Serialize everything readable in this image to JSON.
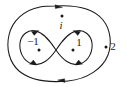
{
  "figure": {
    "type": "contour-diagram",
    "background_color": "#ffffff",
    "stroke_color": "#1a1a1a",
    "width": 127,
    "height": 87
  },
  "points": [
    {
      "id": "minus-one",
      "label": "−1",
      "style": "upright",
      "x": 39,
      "y": 50,
      "label_x": 33,
      "label_y": 42,
      "location": "inside left lobe"
    },
    {
      "id": "plus-one",
      "label": "1",
      "style": "upright",
      "x": 73,
      "y": 50,
      "label_x": 78,
      "label_y": 43,
      "location": "inside right lobe"
    },
    {
      "id": "imaginary-unit",
      "label": "i",
      "style": "italic",
      "x": 62,
      "y": 16,
      "label_x": 60,
      "label_y": 25,
      "location": "inside outer contour, above figure-eight"
    },
    {
      "id": "two",
      "label": "2",
      "style": "upright",
      "x": 106,
      "y": 47,
      "label_x": 112,
      "label_y": 47,
      "location": "outside outer contour, to the right"
    }
  ],
  "contours": [
    {
      "id": "outer-contour",
      "shape": "closed rounded loop enclosing everything",
      "orientation": "counterclockwise",
      "arrow_directions": [
        "left at top",
        "right at bottom"
      ]
    },
    {
      "id": "figure-eight-contour",
      "shape": "lemniscate crossing at center",
      "left_lobe_orientation": "clockwise",
      "right_lobe_orientation": "counterclockwise",
      "crossing_x": 56,
      "crossing_y": 50,
      "arrow_directions": [
        "right at left-lobe top",
        "left at left-lobe bottom",
        "left at right-lobe top",
        "right at right-lobe bottom"
      ]
    }
  ]
}
